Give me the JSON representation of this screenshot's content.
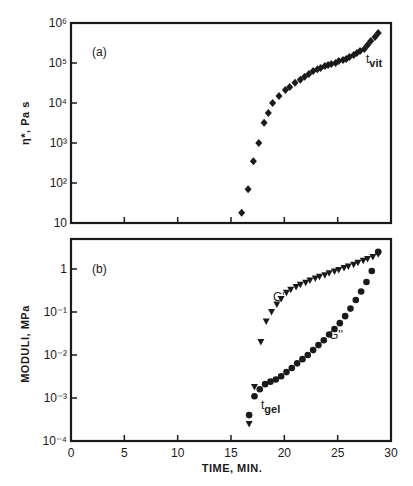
{
  "chart_data": [
    {
      "type": "scatter",
      "panel": "(a)",
      "title": "",
      "xlabel": "TIME, MIN.",
      "ylabel": "η*, Pa s",
      "yscale": "log",
      "xlim": [
        0,
        30
      ],
      "ylim": [
        10,
        1000000
      ],
      "y_tick_labels": [
        "10",
        "10²",
        "10³",
        "10⁴",
        "10⁵",
        "10⁶"
      ],
      "x_ticks": [
        0,
        5,
        10,
        15,
        20,
        25,
        30
      ],
      "grid": false,
      "annotations": [
        {
          "text": "t",
          "sub": "vit",
          "x": 27.2,
          "y": 200000
        }
      ],
      "series": [
        {
          "name": "η*",
          "marker": "diamond",
          "x": [
            16.0,
            16.6,
            17.1,
            17.6,
            18.1,
            18.5,
            18.9,
            19.5,
            20.1,
            20.5,
            21.0,
            21.5,
            21.9,
            22.3,
            22.7,
            23.1,
            23.4,
            23.8,
            24.1,
            24.4,
            24.8,
            25.1,
            25.5,
            25.8,
            26.1,
            26.5,
            26.8,
            27.1,
            27.5,
            27.8,
            28.1,
            28.5,
            28.8
          ],
          "y": [
            18,
            70,
            350,
            1000,
            3200,
            5600,
            10000,
            15000,
            21000,
            25000,
            32000,
            38000,
            45000,
            53000,
            63000,
            70000,
            75000,
            84000,
            89000,
            94000,
            100000,
            112000,
            118000,
            126000,
            141000,
            158000,
            178000,
            200000,
            224000,
            282000,
            355000,
            447000,
            562000
          ]
        }
      ]
    },
    {
      "type": "scatter",
      "panel": "(b)",
      "title": "",
      "xlabel": "TIME, MIN.",
      "ylabel": "MODULI, MPa",
      "yscale": "log",
      "xlim": [
        0,
        30
      ],
      "ylim": [
        0.0001,
        3
      ],
      "y_tick_labels": [
        "10⁻⁴",
        "10⁻³",
        "10⁻²",
        "10⁻¹",
        "1"
      ],
      "x_ticks": [
        0,
        5,
        10,
        15,
        20,
        25,
        30
      ],
      "grid": false,
      "annotations": [
        {
          "text": "G'",
          "x": 20.1,
          "y": 0.2
        },
        {
          "text": "G''",
          "x": 25.1,
          "y": 0.013
        },
        {
          "text": "t",
          "sub": "gel",
          "x": 17.8,
          "y": 0.0006
        }
      ],
      "series": [
        {
          "name": "G'",
          "marker": "triangle-down",
          "x": [
            16.7,
            17.2,
            17.8,
            18.3,
            18.8,
            19.3,
            19.7,
            20.2,
            20.6,
            21.1,
            21.5,
            22.0,
            22.4,
            22.9,
            23.3,
            23.8,
            24.2,
            24.7,
            25.1,
            25.6,
            26.0,
            26.5,
            26.9,
            27.4,
            27.8,
            28.3,
            28.8
          ],
          "y": [
            0.00025,
            0.0018,
            0.02,
            0.06,
            0.1,
            0.15,
            0.2,
            0.28,
            0.33,
            0.38,
            0.43,
            0.48,
            0.54,
            0.6,
            0.66,
            0.72,
            0.8,
            0.88,
            0.95,
            1.05,
            1.15,
            1.25,
            1.4,
            1.55,
            1.7,
            1.9,
            2.2
          ]
        },
        {
          "name": "G''",
          "marker": "circle",
          "x": [
            16.7,
            17.2,
            17.7,
            18.2,
            18.7,
            19.2,
            19.7,
            20.2,
            20.7,
            21.2,
            21.7,
            22.2,
            22.7,
            23.2,
            23.7,
            24.2,
            24.7,
            25.2,
            25.7,
            26.2,
            26.7,
            27.2,
            27.7,
            28.2,
            28.8
          ],
          "y": [
            0.0004,
            0.0011,
            0.0016,
            0.0021,
            0.0024,
            0.0027,
            0.0032,
            0.004,
            0.005,
            0.0064,
            0.008,
            0.01,
            0.013,
            0.017,
            0.022,
            0.03,
            0.04,
            0.055,
            0.08,
            0.12,
            0.19,
            0.3,
            0.5,
            0.9,
            2.5
          ]
        }
      ]
    }
  ],
  "labels": {
    "panel_a": "(a)",
    "panel_b": "(b)",
    "ylabel_a": "η*, Pa s",
    "ylabel_b": "MODULI, MPa",
    "xlabel": "TIME, MIN.",
    "t_vit": "t",
    "t_vit_sub": "vit",
    "t_gel": "t",
    "t_gel_sub": "gel",
    "g_prime": "G'",
    "g_double_prime": "G''"
  }
}
